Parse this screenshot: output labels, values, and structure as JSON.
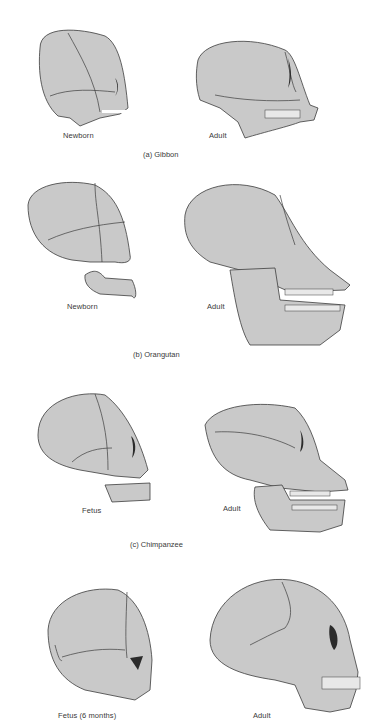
{
  "figure": {
    "panels": [
      {
        "id": "a",
        "caption": "(a)  Gibbon",
        "left_label": "Newborn",
        "right_label": "Adult"
      },
      {
        "id": "b",
        "caption": "(b)  Orangutan",
        "left_label": "Newborn",
        "right_label": "Adult"
      },
      {
        "id": "c",
        "caption": "(c)  Chimpanzee",
        "left_label": "Fetus",
        "right_label": "Adult"
      },
      {
        "id": "d",
        "caption": "",
        "left_label": "Fetus (6 months)",
        "right_label": "Adult"
      }
    ],
    "colors": {
      "bone": "#c9c9c9",
      "outline": "#3c3c3c",
      "text": "#3a3a3a",
      "background": "#ffffff"
    }
  }
}
